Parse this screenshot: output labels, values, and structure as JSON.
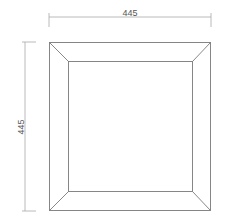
{
  "drawing": {
    "title": "Square frame elevation",
    "width_label": "445",
    "height_label": "445",
    "line_color": "#7a7a7a",
    "dim_color": "#a0a0a0",
    "text_color": "#555555"
  }
}
